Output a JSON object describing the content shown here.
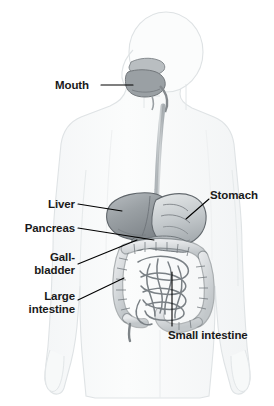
{
  "figure": {
    "background_color": "#ffffff",
    "body_outline_color": "#d9dde0",
    "body_fill_color": "#fafbfb",
    "organ_stroke_color": "#6b7074",
    "leader_line_color": "#000000",
    "label_text_color": "#1a1a1a"
  },
  "labels": {
    "mouth": "Mouth",
    "stomach": "Stomach",
    "liver": "Liver",
    "pancreas": "Pancreas",
    "gallbladder_line1": "Gall-",
    "gallbladder_line2": "bladder",
    "large_intestine_line1": "Large",
    "large_intestine_line2": "intestine",
    "small_intestine": "Small intestine"
  },
  "organs": [
    {
      "name": "mouth",
      "label": "Mouth",
      "fill": "#9a9fa3"
    },
    {
      "name": "esophagus",
      "label": "Esophagus",
      "fill": "#bfc4c7"
    },
    {
      "name": "stomach",
      "label": "Stomach",
      "fill": "#c3c8cb"
    },
    {
      "name": "liver",
      "label": "Liver",
      "fill": "#9ba0a4"
    },
    {
      "name": "pancreas",
      "label": "Pancreas",
      "fill": "#b4b9bd"
    },
    {
      "name": "gallbladder",
      "label": "Gall-bladder",
      "fill": "#8f9498"
    },
    {
      "name": "large-intestine",
      "label": "Large intestine",
      "fill": "#d4d8da"
    },
    {
      "name": "small-intestine",
      "label": "Small intestine",
      "fill": "#e2e5e7"
    }
  ]
}
